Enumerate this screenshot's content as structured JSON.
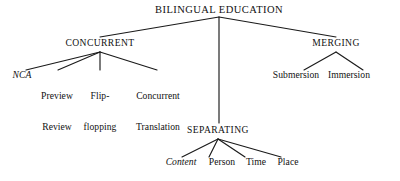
{
  "diagram": {
    "title": "BILINGUAL EDUCATION",
    "type": "tree",
    "style": {
      "line_color": "#1a1a1a",
      "text_color": "#111111",
      "background": "#ffffff"
    },
    "root": {
      "label": "BILINGUAL EDUCATION",
      "x": 219,
      "y": 10
    },
    "branches": [
      {
        "label": "CONCURRENT",
        "x": 100,
        "y": 44,
        "children": [
          {
            "label": "NCA",
            "italic": true,
            "x": 22,
            "y": 76,
            "lines": [
              "NCA"
            ]
          },
          {
            "label": "Preview Review",
            "italic": false,
            "x": 57,
            "y": 76,
            "lines": [
              "Preview",
              "Review"
            ]
          },
          {
            "label": "Flip-flopping",
            "italic": false,
            "x": 100,
            "y": 76,
            "lines": [
              "Flip-",
              "flopping"
            ]
          },
          {
            "label": "Concurrent Translation",
            "italic": false,
            "x": 158,
            "y": 76,
            "lines": [
              "Concurrent",
              "Translation"
            ]
          }
        ]
      },
      {
        "label": "SEPARATING",
        "x": 218,
        "y": 131,
        "children": [
          {
            "label": "Content",
            "italic": true,
            "x": 181,
            "y": 163,
            "lines": [
              "Content"
            ]
          },
          {
            "label": "Person",
            "italic": false,
            "x": 222,
            "y": 163,
            "lines": [
              "Person"
            ]
          },
          {
            "label": "Time",
            "italic": false,
            "x": 256,
            "y": 163,
            "lines": [
              "Time"
            ]
          },
          {
            "label": "Place",
            "italic": false,
            "x": 288,
            "y": 163,
            "lines": [
              "Place"
            ]
          }
        ]
      },
      {
        "label": "MERGING",
        "x": 336,
        "y": 44,
        "children": [
          {
            "label": "Submersion",
            "italic": false,
            "x": 296,
            "y": 76,
            "lines": [
              "Submersion"
            ]
          },
          {
            "label": "Immersion",
            "italic": false,
            "x": 349,
            "y": 76,
            "lines": [
              "Immersion"
            ]
          }
        ]
      }
    ],
    "edges": [
      {
        "from": "root",
        "to": "CONCURRENT",
        "x1": 219,
        "y1": 17,
        "x2": 100,
        "y2": 37
      },
      {
        "from": "root",
        "to": "SEPARATING",
        "x1": 219,
        "y1": 17,
        "x2": 219,
        "y2": 123
      },
      {
        "from": "root",
        "to": "MERGING",
        "x1": 219,
        "y1": 17,
        "x2": 336,
        "y2": 37
      },
      {
        "from": "CONCURRENT",
        "to": "NCA",
        "x1": 100,
        "y1": 52,
        "x2": 26,
        "y2": 70
      },
      {
        "from": "CONCURRENT",
        "to": "Preview Review",
        "x1": 100,
        "y1": 52,
        "x2": 58,
        "y2": 70
      },
      {
        "from": "CONCURRENT",
        "to": "Flip-flopping",
        "x1": 100,
        "y1": 52,
        "x2": 100,
        "y2": 70
      },
      {
        "from": "CONCURRENT",
        "to": "Concurrent Translation",
        "x1": 100,
        "y1": 52,
        "x2": 157,
        "y2": 70
      },
      {
        "from": "SEPARATING",
        "to": "Content",
        "x1": 218,
        "y1": 139,
        "x2": 182,
        "y2": 157
      },
      {
        "from": "SEPARATING",
        "to": "Person",
        "x1": 218,
        "y1": 139,
        "x2": 209,
        "y2": 157
      },
      {
        "from": "SEPARATING",
        "to": "Time",
        "x1": 218,
        "y1": 139,
        "x2": 245,
        "y2": 157
      },
      {
        "from": "SEPARATING",
        "to": "Place",
        "x1": 218,
        "y1": 139,
        "x2": 281,
        "y2": 157
      },
      {
        "from": "MERGING",
        "to": "Submersion",
        "x1": 336,
        "y1": 52,
        "x2": 304,
        "y2": 70
      },
      {
        "from": "MERGING",
        "to": "Immersion",
        "x1": 336,
        "y1": 52,
        "x2": 363,
        "y2": 70
      }
    ]
  }
}
